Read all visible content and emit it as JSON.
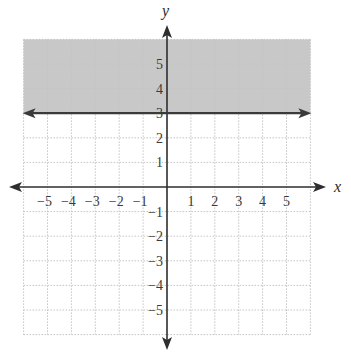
{
  "chart_data": {
    "type": "inequality-graph",
    "title": "",
    "xlabel": "x",
    "ylabel": "y",
    "xlim": [
      -6,
      6
    ],
    "ylim": [
      -6,
      6
    ],
    "grid": true,
    "grid_style": "dotted",
    "x_ticks": [
      -5,
      -4,
      -3,
      -2,
      -1,
      1,
      2,
      3,
      4,
      5
    ],
    "y_ticks": [
      5,
      4,
      3,
      2,
      1,
      -1,
      -2,
      -3,
      -4,
      -5
    ],
    "x_tick_labels": [
      "−5",
      "−4",
      "−3",
      "−2",
      "−1",
      "1",
      "2",
      "3",
      "4",
      "5"
    ],
    "y_tick_labels": [
      "5",
      "4",
      "3",
      "2",
      "1",
      "−1",
      "−2",
      "−3",
      "−4",
      "−5"
    ],
    "boundary_line": {
      "equation": "y = 3",
      "y": 3,
      "style": "solid",
      "arrows": "both"
    },
    "shaded_region": {
      "description": "y >= 3",
      "from_y": 3,
      "to_y": 6,
      "color": "#c8c8c8"
    },
    "inequality": "y ≥ 3"
  },
  "colors": {
    "shade": "#c8c8c8",
    "axis": "#2e2e2e",
    "grid": "#c4c4c4",
    "line": "#3a3a3a"
  }
}
